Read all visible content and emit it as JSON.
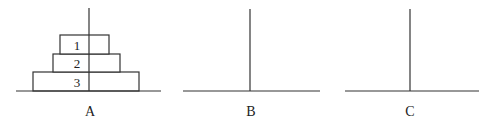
{
  "diagram": {
    "colors": {
      "stroke": "#333333",
      "text": "#222222",
      "background": "#ffffff"
    },
    "rods": [
      {
        "label": "A",
        "x": 89,
        "base_x1": 16,
        "base_x2": 161
      },
      {
        "label": "B",
        "x": 250,
        "base_x1": 183,
        "base_x2": 320
      },
      {
        "label": "C",
        "x": 410,
        "base_x1": 345,
        "base_x2": 479
      }
    ],
    "disks": [
      {
        "label": "1",
        "rod": "A",
        "x1": 60,
        "x2": 109,
        "y1": 35,
        "y2": 54
      },
      {
        "label": "2",
        "rod": "A",
        "x1": 53,
        "x2": 120,
        "y1": 54,
        "y2": 72
      },
      {
        "label": "3",
        "rod": "A",
        "x1": 33,
        "x2": 139,
        "y1": 72,
        "y2": 91
      }
    ]
  }
}
